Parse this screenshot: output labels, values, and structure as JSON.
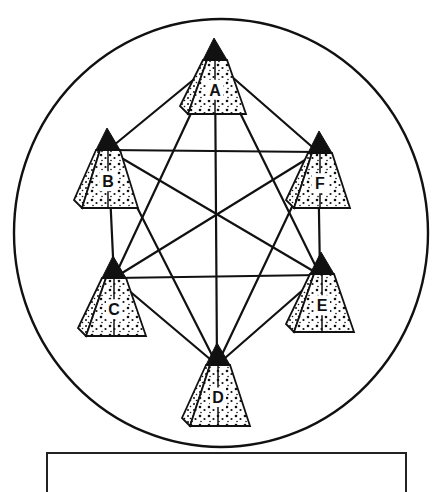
{
  "diagram": {
    "type": "complete-graph",
    "boundary": {
      "shape": "ellipse",
      "cx": 221,
      "cy": 233,
      "rx": 207,
      "ry": 214
    },
    "nodes": [
      {
        "id": "A",
        "label": "A",
        "apex": [
          214,
          38
        ],
        "hub": [
          215,
          62
        ],
        "baseY": 112,
        "halfTop": 9,
        "halfBase": 31
      },
      {
        "id": "B",
        "label": "B",
        "apex": [
          107,
          128
        ],
        "hub": [
          108,
          150
        ],
        "baseY": 206,
        "halfTop": 9,
        "halfBase": 30
      },
      {
        "id": "F",
        "label": "F",
        "apex": [
          319,
          131
        ],
        "hub": [
          318,
          152
        ],
        "baseY": 206,
        "halfTop": 9,
        "halfBase": 30
      },
      {
        "id": "C",
        "label": "C",
        "apex": [
          113,
          256
        ],
        "hub": [
          114,
          278
        ],
        "baseY": 334,
        "halfTop": 9,
        "halfBase": 32
      },
      {
        "id": "E",
        "label": "E",
        "apex": [
          321,
          252
        ],
        "hub": [
          320,
          275
        ],
        "baseY": 330,
        "halfTop": 9,
        "halfBase": 32
      },
      {
        "id": "D",
        "label": "D",
        "apex": [
          217,
          343
        ],
        "hub": [
          217,
          365
        ],
        "baseY": 424,
        "halfTop": 9,
        "halfBase": 32
      }
    ],
    "edges": [
      [
        "A",
        "B"
      ],
      [
        "A",
        "F"
      ],
      [
        "A",
        "C"
      ],
      [
        "A",
        "E"
      ],
      [
        "A",
        "D"
      ],
      [
        "B",
        "F"
      ],
      [
        "B",
        "C"
      ],
      [
        "B",
        "E"
      ],
      [
        "B",
        "D"
      ],
      [
        "F",
        "C"
      ],
      [
        "F",
        "E"
      ],
      [
        "F",
        "D"
      ],
      [
        "C",
        "E"
      ],
      [
        "C",
        "D"
      ],
      [
        "E",
        "D"
      ]
    ],
    "colors": {
      "ink": "#111111",
      "fill": "#ffffff"
    }
  },
  "caption": {
    "text": ""
  }
}
